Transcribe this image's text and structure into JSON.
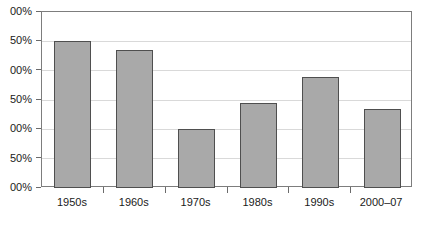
{
  "chart_data": {
    "type": "bar",
    "title": "",
    "xlabel": "",
    "ylabel": "",
    "categories": [
      "1950s",
      "1960s",
      "1970s",
      "1980s",
      "1990s",
      "2000–07"
    ],
    "values": [
      250,
      235,
      100,
      145,
      190,
      135
    ],
    "ylim": [
      0,
      300
    ],
    "ytick_values": [
      0,
      50,
      100,
      150,
      200,
      250,
      300
    ],
    "ytick_labels": [
      "00%",
      "50%",
      "00%",
      "50%",
      "00%",
      "50%",
      "00%"
    ],
    "ytick_labels_full": [
      "0%",
      "50%",
      "100%",
      "150%",
      "200%",
      "250%",
      "300%"
    ],
    "grid": true,
    "legend": false,
    "legend_position": "none",
    "series": [
      {
        "name": "",
        "values": [
          250,
          235,
          100,
          145,
          190,
          135
        ]
      }
    ]
  },
  "style": {
    "bar_fill": "#a9a9a9",
    "bar_border": "#4f4f4f",
    "grid_color": "#d9d9d9",
    "frame_color": "#7d7d7d",
    "axis_color": "#6b6b6b",
    "text_color": "#1a1a1a",
    "background": "#ffffff"
  }
}
